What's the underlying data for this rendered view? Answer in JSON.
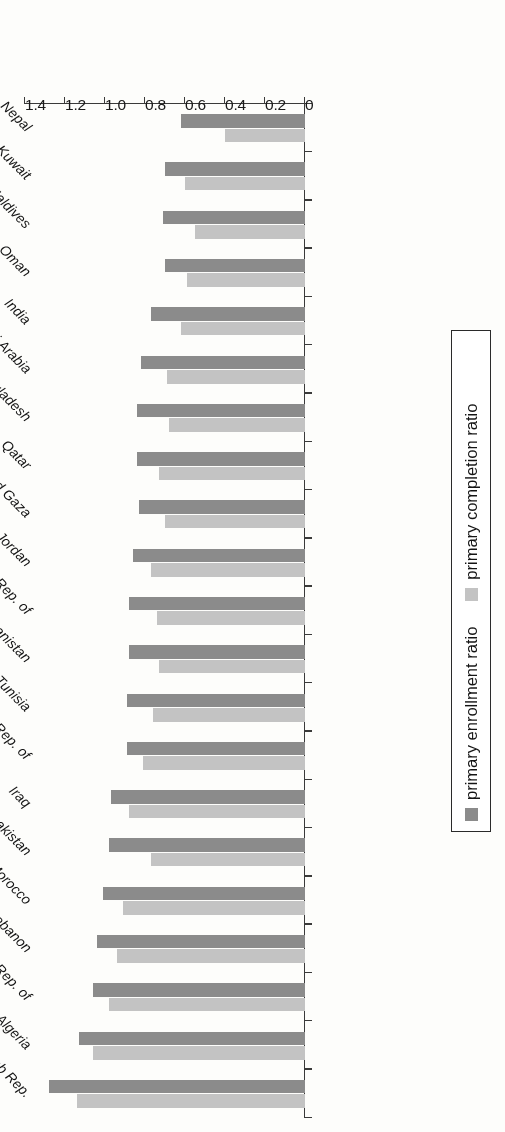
{
  "chart_data": {
    "type": "bar",
    "orientation": "horizontal",
    "title": "",
    "xlabel": "ratio",
    "ylabel": "",
    "xlim": [
      0,
      1.4
    ],
    "xticks": [
      "0",
      "0.2",
      "0.4",
      "0.6",
      "0.8",
      "1.0",
      "1.2",
      "1.4"
    ],
    "xtick_values": [
      0,
      0.2,
      0.4,
      0.6,
      0.8,
      1.0,
      1.2,
      1.4
    ],
    "grid": false,
    "legend_position": "right",
    "categories": [
      "Nepal",
      "Kuwait",
      "Maldives",
      "Oman",
      "India",
      "Saudi Arabia",
      "Bangladesh",
      "Qatar",
      "West Bank and Gaza",
      "Jordan",
      "Yemen, Rep. of",
      "Afghanistan",
      "Tunisia",
      "Iran, Islamic Rep. of",
      "Iraq",
      "Pakistan",
      "Morocco",
      "Lebanon",
      "Egypt, Arab Rep. of",
      "Algeria",
      "Syrian Arab Rep."
    ],
    "series": [
      {
        "name": "primary enrollment ratio",
        "color": "#8b8b8b",
        "values": [
          0.62,
          0.7,
          0.71,
          0.7,
          0.77,
          0.82,
          0.84,
          0.84,
          0.83,
          0.86,
          0.88,
          0.88,
          0.89,
          0.89,
          0.97,
          0.98,
          1.01,
          1.04,
          1.06,
          1.13,
          1.28
        ]
      },
      {
        "name": "primary completion ratio",
        "color": "#c3c3c3",
        "values": [
          0.4,
          0.6,
          0.55,
          0.59,
          0.62,
          0.69,
          0.68,
          0.73,
          0.7,
          0.77,
          0.74,
          0.73,
          0.76,
          0.81,
          0.88,
          0.77,
          0.91,
          0.94,
          0.98,
          1.06,
          1.14
        ]
      }
    ]
  },
  "legend": {
    "entries": [
      {
        "label": "primary enrollment ratio",
        "color": "#8b8b8b"
      },
      {
        "label": "primary completion ratio",
        "color": "#c3c3c3"
      }
    ]
  },
  "axis": {
    "value_axis_title": "ratio"
  }
}
